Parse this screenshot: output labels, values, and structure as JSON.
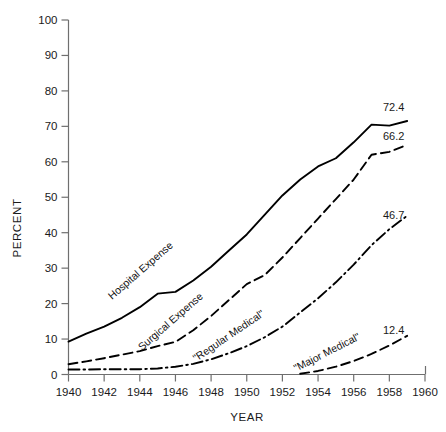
{
  "chart_data": {
    "type": "line",
    "title": "",
    "xlabel": "YEAR",
    "ylabel": "PERCENT",
    "xlim": [
      1940,
      1960
    ],
    "ylim": [
      0,
      100
    ],
    "grid": false,
    "legend_position": "inline-labels",
    "xticks": [
      "1940",
      "1942",
      "1944",
      "1946",
      "1948",
      "1950",
      "1952",
      "1954",
      "1956",
      "1958",
      "1960"
    ],
    "yticks": [
      "0",
      "10",
      "20",
      "30",
      "40",
      "50",
      "60",
      "70",
      "80",
      "90",
      "100"
    ],
    "series": [
      {
        "name": "Hospital Expense",
        "label": "Hospital Expense",
        "style": "solid",
        "end_value": "72.4",
        "x": [
          1940,
          1941,
          1942,
          1943,
          1944,
          1945,
          1946,
          1947,
          1948,
          1949,
          1950,
          1951,
          1952,
          1953,
          1954,
          1955,
          1956,
          1957,
          1958,
          1959
        ],
        "values": [
          9.3,
          11.5,
          13.5,
          16.0,
          19.0,
          22.8,
          23.3,
          26.5,
          30.4,
          35.0,
          39.5,
          45.0,
          50.5,
          55.0,
          58.7,
          61.0,
          65.5,
          70.5,
          70.2,
          71.5
        ]
      },
      {
        "name": "Surgical Expense",
        "label": "Surgical Expense",
        "style": "dashed",
        "end_value": "66.2",
        "x": [
          1940,
          1941,
          1942,
          1943,
          1944,
          1945,
          1946,
          1947,
          1948,
          1949,
          1950,
          1951,
          1952,
          1953,
          1954,
          1955,
          1956,
          1957,
          1958,
          1959
        ],
        "values": [
          2.9,
          3.7,
          4.6,
          5.6,
          6.6,
          8.0,
          9.2,
          12.5,
          16.5,
          21.0,
          25.5,
          28.0,
          33.0,
          38.5,
          44.0,
          49.5,
          55.0,
          62.0,
          62.8,
          64.8
        ]
      },
      {
        "name": "Regular Medical",
        "label": "\"Regular Medical\"",
        "style": "dashdot",
        "end_value": "46.7",
        "x": [
          1940,
          1941,
          1942,
          1943,
          1944,
          1945,
          1946,
          1947,
          1948,
          1949,
          1950,
          1951,
          1952,
          1953,
          1954,
          1955,
          1956,
          1957,
          1958,
          1959
        ],
        "values": [
          1.4,
          1.4,
          1.5,
          1.5,
          1.5,
          1.7,
          2.2,
          3.0,
          4.3,
          6.0,
          8.0,
          10.5,
          13.5,
          17.5,
          21.5,
          26.0,
          31.0,
          36.5,
          41.0,
          44.8
        ]
      },
      {
        "name": "Major Medical",
        "label": "\"Major Medical\"",
        "style": "dashed-thin",
        "end_value": "12.4",
        "x": [
          1953,
          1954,
          1955,
          1956,
          1957,
          1958,
          1959
        ],
        "values": [
          0.2,
          1.0,
          2.2,
          3.8,
          5.8,
          8.2,
          10.9
        ]
      }
    ]
  },
  "colors": {
    "line": "#000000",
    "axis": "#6f6f6f",
    "text": "#1a1a1a",
    "background": "#ffffff"
  }
}
